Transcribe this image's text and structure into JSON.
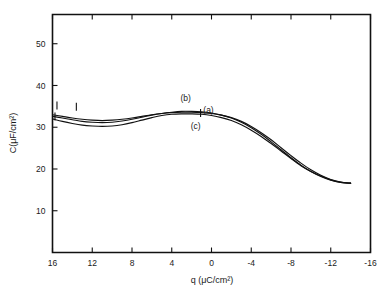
{
  "chart_data": {
    "type": "line",
    "title": "",
    "xlabel": "q (μC/cm²)",
    "ylabel": "C(μF/cm²)",
    "xlim": [
      16,
      -16
    ],
    "ylim": [
      0,
      57
    ],
    "x_reversed": true,
    "grid": false,
    "legend": "inline-labels",
    "xticks": [
      16,
      12,
      8,
      4,
      0,
      -4,
      -8,
      -12,
      -16
    ],
    "xtick_labels": [
      "16",
      "12",
      "8",
      "4",
      "0",
      "-4",
      "-8",
      "-12",
      "-16"
    ],
    "yticks": [
      10,
      20,
      30,
      40,
      50
    ],
    "ytick_labels": [
      "10",
      "20",
      "30",
      "40",
      "50"
    ],
    "series": [
      {
        "name": "(a)",
        "label": "(a)",
        "label_x": 0.3,
        "label_y": 33.4,
        "x": [
          16.0,
          15.0,
          14.0,
          13.0,
          12.0,
          11.0,
          10.0,
          9.0,
          8.0,
          7.0,
          6.0,
          5.0,
          4.0,
          3.0,
          2.0,
          1.0,
          0.0,
          -1.0,
          -2.0,
          -3.0,
          -4.0,
          -5.0,
          -6.0,
          -7.0,
          -8.0,
          -9.0,
          -10.0,
          -11.0,
          -12.0,
          -13.0,
          -14.0
        ],
        "values": [
          33.0,
          32.6,
          32.2,
          31.9,
          31.7,
          31.6,
          31.7,
          31.9,
          32.2,
          32.6,
          33.0,
          33.3,
          33.5,
          33.6,
          33.6,
          33.5,
          33.3,
          32.9,
          32.3,
          31.4,
          30.2,
          28.7,
          27.0,
          25.1,
          23.2,
          21.4,
          19.8,
          18.5,
          17.5,
          16.9,
          16.6
        ]
      },
      {
        "name": "(b)",
        "label": "(b)",
        "label_x": 2.6,
        "label_y": 36.2,
        "x": [
          16.0,
          15.0,
          14.0,
          13.0,
          12.0,
          11.0,
          10.0,
          9.0,
          8.0,
          7.0,
          6.0,
          5.0,
          4.0,
          3.0,
          2.0,
          1.0,
          0.0,
          -1.0,
          -2.0,
          -3.0,
          -4.0,
          -5.0,
          -6.0,
          -7.0,
          -8.0,
          -9.0,
          -10.0,
          -11.0,
          -12.0,
          -13.0,
          -14.0
        ],
        "values": [
          32.6,
          32.2,
          31.8,
          31.4,
          31.2,
          31.1,
          31.2,
          31.5,
          31.9,
          32.4,
          32.9,
          33.3,
          33.6,
          33.8,
          33.8,
          33.7,
          33.4,
          32.9,
          32.2,
          31.2,
          29.9,
          28.3,
          26.5,
          24.6,
          22.7,
          20.9,
          19.4,
          18.2,
          17.3,
          16.8,
          16.6
        ]
      },
      {
        "name": "(c)",
        "label": "(c)",
        "label_x": 1.6,
        "label_y": 29.6,
        "x": [
          16.0,
          15.0,
          14.0,
          13.0,
          12.0,
          11.0,
          10.0,
          9.0,
          8.0,
          7.0,
          6.0,
          5.0,
          4.0,
          3.0,
          2.0,
          1.0,
          0.0,
          -1.0,
          -2.0,
          -3.0,
          -4.0,
          -5.0,
          -6.0,
          -7.0,
          -8.0,
          -9.0,
          -10.0,
          -11.0,
          -12.0,
          -13.0,
          -14.0
        ],
        "values": [
          32.0,
          31.4,
          30.9,
          30.5,
          30.3,
          30.2,
          30.3,
          30.6,
          31.1,
          31.7,
          32.3,
          32.8,
          33.1,
          33.2,
          33.2,
          33.1,
          32.8,
          32.3,
          31.6,
          30.6,
          29.3,
          27.8,
          26.1,
          24.3,
          22.5,
          20.8,
          19.4,
          18.3,
          17.4,
          16.8,
          16.6
        ]
      }
    ],
    "markers": [
      {
        "name": "tick-mark-upper-left",
        "x": 15.55,
        "y": 35.2
      },
      {
        "name": "tick-mark-lower-left",
        "x": 15.75,
        "y": 32.6
      },
      {
        "name": "tick-mark-curve-b-left",
        "x": 13.6,
        "y": 34.9
      },
      {
        "name": "tick-mark-curve-b-label",
        "x": 1.1,
        "y": 33.4
      }
    ]
  }
}
